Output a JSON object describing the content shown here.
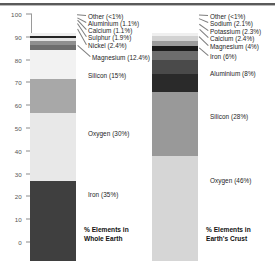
{
  "chart_data": [
    {
      "type": "bar",
      "title": "% Elements in Whole Earth",
      "xlabel": "",
      "ylabel": "",
      "ylim": [
        0,
        100
      ],
      "grid": false,
      "legend": "none",
      "yticks": [
        "0",
        "10",
        "20",
        "30",
        "40",
        "50",
        "60",
        "70",
        "80",
        "90",
        "100"
      ],
      "categories": [
        "Iron",
        "Oxygen",
        "Silicon",
        "Magnesium",
        "Nickel",
        "Sulphur",
        "Calcium",
        "Aluminium",
        "Other"
      ],
      "values": [
        35,
        30,
        15,
        12.4,
        2.4,
        1.9,
        1.1,
        1.1,
        1.0
      ],
      "labels": [
        "Iron (35%)",
        "Oxygen (30%)",
        "Silicon (15%)",
        "Magnesium (12.4%)",
        "Nickel (2.4%)",
        "Sulphur (1.9%)",
        "Calcium (1.1%)",
        "Aluminium (1.1%)",
        "Other (<1%)"
      ],
      "colors": [
        "#3f3f3f",
        "#e8e8e8",
        "#a8a8a8",
        "#f2f2f2",
        "#6e6e6e",
        "#8f8f8f",
        "#e3e3e3",
        "#242424",
        "#efefef"
      ]
    },
    {
      "type": "bar",
      "title": "% Elements in Earth's Crust",
      "xlabel": "",
      "ylabel": "",
      "ylim": [
        0,
        100
      ],
      "grid": false,
      "legend": "none",
      "categories": [
        "Oxygen",
        "Silicon",
        "Aluminium",
        "Iron",
        "Magnesium",
        "Calcium",
        "Potassium",
        "Sodium",
        "Other"
      ],
      "values": [
        46,
        28,
        8,
        6,
        4,
        2.4,
        2.3,
        2.1,
        1.0
      ],
      "labels": [
        "Oxygen (46%)",
        "Silicon (28%)",
        "Aluminium (8%)",
        "Iron (6%)",
        "Magnesium (4%)",
        "Calcium (2.4%)",
        "Potassium (2.3%)",
        "Sodium (2.1%)",
        "Other (<1%)"
      ],
      "colors": [
        "#d6d6d6",
        "#999999",
        "#2a2a2a",
        "#4a4a4a",
        "#6d6d6d",
        "#1c1c1c",
        "#9c9c9c",
        "#d2d2d2",
        "#efefef"
      ]
    }
  ],
  "axis": {
    "ticks": [
      "100",
      "90",
      "80",
      "70",
      "60",
      "50",
      "40",
      "30",
      "20",
      "10",
      "0"
    ]
  },
  "left_chart": {
    "title_line1": "% Elements in",
    "title_line2": "Whole Earth",
    "callouts": [
      "Other (<1%)",
      "Aluminium (1.1%)",
      "Calcium (1.1%)",
      "Sulphur (1.9%)",
      "Nickel (2.4%)",
      "Magnesium (12.4%)"
    ],
    "inner": [
      "Silicon (15%)",
      "Oxygen (30%)",
      "Iron (35%)"
    ]
  },
  "right_chart": {
    "title_line1": "% Elements in",
    "title_line2": "Earth's Crust",
    "callouts": [
      "Other (<1%)",
      "Sodium (2.1%)",
      "Potassium (2.3%)",
      "Calcium (2.4%)",
      "Magnesium (4%)",
      "Iron (6%)"
    ],
    "inner": [
      "Aluminium (8%)",
      "Silicon (28%)",
      "Oxygen (46%)"
    ]
  }
}
